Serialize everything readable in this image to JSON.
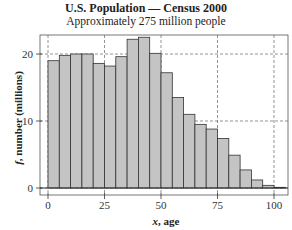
{
  "chart_data": {
    "type": "bar",
    "title": "U.S. Population — Census 2000",
    "subtitle": "Approximately 275 million people",
    "xlabel_var": "x",
    "xlabel_text": ", age",
    "ylabel_var": "f",
    "ylabel_text": ", number (millions)",
    "bin_width": 5,
    "bin_starts": [
      0,
      5,
      10,
      15,
      20,
      25,
      30,
      35,
      40,
      45,
      50,
      55,
      60,
      65,
      70,
      75,
      80,
      85,
      90,
      95,
      100
    ],
    "values": [
      19.0,
      19.8,
      20.0,
      20.0,
      18.6,
      18.2,
      19.6,
      22.2,
      22.5,
      20.1,
      17.2,
      13.5,
      11.0,
      9.5,
      8.8,
      7.4,
      4.9,
      2.7,
      1.2,
      0.4,
      0.1
    ],
    "xticks": [
      0,
      25,
      50,
      75,
      100
    ],
    "yticks": [
      0,
      10,
      20
    ],
    "xlim": [
      -3,
      107
    ],
    "ylim": [
      -1,
      24
    ],
    "grid": true,
    "bar_color": "#c4c4c4",
    "edge_color": "#333333"
  }
}
